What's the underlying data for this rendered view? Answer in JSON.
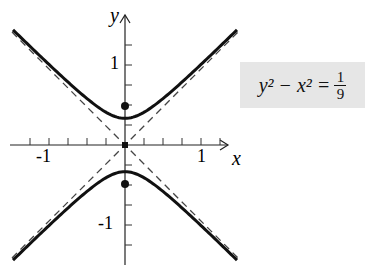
{
  "chart_data": {
    "type": "line",
    "title": "",
    "xlabel": "x",
    "ylabel": "y",
    "xlim": [
      -1.4,
      1.4
    ],
    "ylim": [
      -1.45,
      1.45
    ],
    "x_ticks_labeled": [
      "-1",
      "1"
    ],
    "y_ticks_labeled": [
      "1",
      "-1"
    ],
    "tick_step": 0.25,
    "series": [
      {
        "name": "hyperbola y^2 - x^2 = 1/9",
        "style": "solid",
        "vertices": [
          [
            0,
            0.333
          ],
          [
            0,
            -0.333
          ]
        ]
      },
      {
        "name": "asymptote y = x",
        "style": "dashed"
      },
      {
        "name": "asymptote y = -x",
        "style": "dashed"
      }
    ],
    "points": [
      {
        "label": "focus",
        "x": 0,
        "y": 0.471
      },
      {
        "label": "focus",
        "x": 0,
        "y": -0.471
      },
      {
        "label": "center",
        "x": 0,
        "y": 0
      }
    ],
    "annotation": {
      "lhs": "y² − x² =",
      "num": "1",
      "den": "9"
    }
  }
}
